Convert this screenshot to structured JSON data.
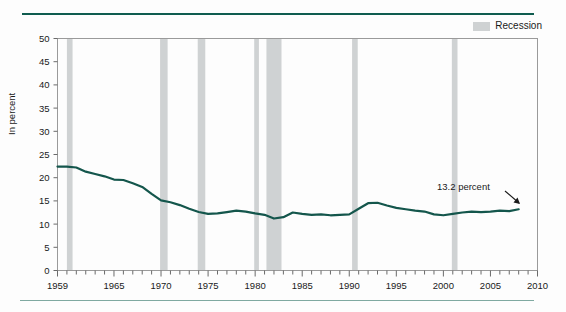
{
  "legend": {
    "items": [
      {
        "label": "Recession",
        "color": "#cfd2d3",
        "icon": "band-swatch-icon"
      }
    ]
  },
  "axis": {
    "ylabel": "In percent",
    "yticks": [
      "0",
      "5",
      "10",
      "15",
      "20",
      "25",
      "30",
      "35",
      "40",
      "45",
      "50"
    ],
    "xticks": [
      "1959",
      "1965",
      "1970",
      "1975",
      "1980",
      "1985",
      "1990",
      "1995",
      "2000",
      "2005",
      "2010"
    ]
  },
  "annotation": {
    "label": "13.2 percent",
    "marker": "arrow-icon"
  },
  "chart_data": {
    "type": "line",
    "title": "",
    "subtitle": "",
    "xlabel": "",
    "ylabel": "In percent",
    "xlim": [
      1959,
      2010
    ],
    "ylim": [
      0,
      50
    ],
    "ytick_step": 5,
    "grid": false,
    "legend_position": "top-right",
    "line_color": "#14564c",
    "line_width": 2.2,
    "series": [
      {
        "name": "Percent",
        "x": [
          1959,
          1960,
          1961,
          1962,
          1963,
          1964,
          1965,
          1966,
          1967,
          1968,
          1969,
          1970,
          1971,
          1972,
          1973,
          1974,
          1975,
          1976,
          1977,
          1978,
          1979,
          1980,
          1981,
          1982,
          1983,
          1984,
          1985,
          1986,
          1987,
          1988,
          1989,
          1990,
          1991,
          1992,
          1993,
          1994,
          1995,
          1996,
          1997,
          1998,
          1999,
          2000,
          2001,
          2002,
          2003,
          2004,
          2005,
          2006,
          2007,
          2008
        ],
        "values": [
          22.4,
          22.4,
          22.2,
          21.3,
          20.8,
          20.3,
          19.6,
          19.5,
          18.8,
          18.0,
          16.5,
          15.1,
          14.7,
          14.1,
          13.3,
          12.6,
          12.2,
          12.3,
          12.6,
          12.9,
          12.7,
          12.3,
          12.0,
          11.2,
          11.5,
          12.5,
          12.2,
          12.0,
          12.1,
          11.9,
          12.0,
          12.1,
          13.3,
          14.5,
          14.6,
          14.0,
          13.5,
          13.2,
          12.9,
          12.7,
          12.1,
          11.9,
          12.2,
          12.5,
          12.7,
          12.6,
          12.7,
          12.9,
          12.8,
          13.2
        ]
      }
    ],
    "bands": [
      {
        "name": "recession-1960",
        "start": 1960.0,
        "end": 1960.6
      },
      {
        "name": "recession-1970",
        "start": 1969.9,
        "end": 1970.7
      },
      {
        "name": "recession-1974",
        "start": 1973.9,
        "end": 1974.7
      },
      {
        "name": "recession-1980",
        "start": 1979.9,
        "end": 1980.4
      },
      {
        "name": "recession-1981",
        "start": 1981.2,
        "end": 1982.8
      },
      {
        "name": "recession-1990",
        "start": 1990.3,
        "end": 1990.9
      },
      {
        "name": "recession-2001",
        "start": 2000.9,
        "end": 2001.5
      }
    ],
    "annotations": [
      {
        "text": "13.2 percent",
        "x": 2008,
        "y": 13.2
      }
    ]
  }
}
